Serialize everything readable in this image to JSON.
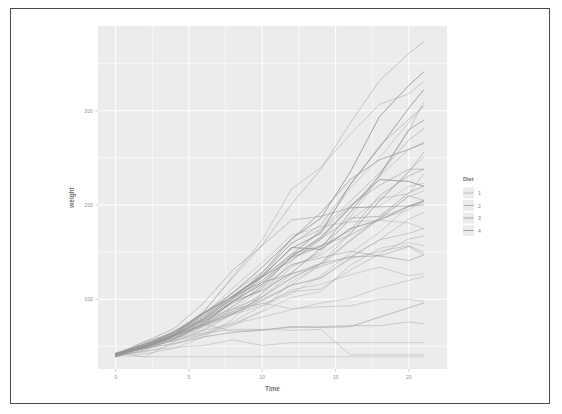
{
  "chart_data": {
    "type": "line",
    "title": "",
    "subtitle": "",
    "xlabel": "Time",
    "ylabel": "weight",
    "xlim": [
      -1.2,
      22.6
    ],
    "ylim": [
      26,
      390
    ],
    "grid": true,
    "x_ticks": [
      0,
      5,
      10,
      15,
      20
    ],
    "x_tick_labels": [
      "0",
      "5",
      "10",
      "15",
      "20"
    ],
    "y_ticks": [
      100,
      200,
      300
    ],
    "y_tick_labels": [
      "100",
      "200",
      "300"
    ],
    "x_minor_ticks": [
      2.5,
      7.5,
      12.5,
      17.5
    ],
    "y_minor_ticks": [
      50,
      150,
      250,
      350
    ],
    "legend": {
      "title": "Diet",
      "position": "right",
      "entries": [
        {
          "label": "1",
          "color": "#b3b3b3"
        },
        {
          "label": "2",
          "color": "#a8a8a8"
        },
        {
          "label": "3",
          "color": "#9d9d9d"
        },
        {
          "label": "4",
          "color": "#949494"
        }
      ]
    },
    "colors": {
      "panel_background": "#ececec",
      "gridline": "#ffffff",
      "page_background": "#ffffff",
      "frame_border": "#4a4a4a",
      "tick_text": "#9a9a9a",
      "axis_title": "#6d6d6d"
    },
    "x": [
      0,
      2,
      4,
      6,
      8,
      10,
      12,
      14,
      16,
      18,
      20,
      21
    ],
    "series": [
      {
        "name": "1",
        "diet": "1",
        "color": "#b3b3b3",
        "values": [
          42,
          51,
          59,
          64,
          76,
          93,
          106,
          125,
          149,
          171,
          199,
          205
        ]
      },
      {
        "name": "2",
        "diet": "1",
        "color": "#b3b3b3",
        "values": [
          40,
          49,
          58,
          72,
          84,
          103,
          122,
          138,
          162,
          187,
          209,
          215
        ]
      },
      {
        "name": "3",
        "diet": "1",
        "color": "#b3b3b3",
        "values": [
          43,
          39,
          55,
          67,
          84,
          99,
          115,
          138,
          163,
          187,
          198,
          202
        ]
      },
      {
        "name": "4",
        "diet": "1",
        "color": "#b3b3b3",
        "values": [
          42,
          49,
          56,
          67,
          74,
          87,
          102,
          108,
          136,
          154,
          160,
          157
        ]
      },
      {
        "name": "5",
        "diet": "1",
        "color": "#b3b3b3",
        "values": [
          41,
          42,
          48,
          60,
          79,
          106,
          141,
          164,
          197,
          199,
          220,
          223
        ]
      },
      {
        "name": "6",
        "diet": "1",
        "color": "#b3b3b3",
        "values": [
          41,
          49,
          59,
          74,
          97,
          124,
          141,
          164,
          186,
          188,
          213,
          220
        ]
      },
      {
        "name": "7",
        "diet": "1",
        "color": "#b3b3b3",
        "values": [
          41,
          49,
          57,
          71,
          89,
          112,
          146,
          174,
          218,
          250,
          288,
          305
        ]
      },
      {
        "name": "8",
        "diet": "1",
        "color": "#b3b3b3",
        "values": [
          42,
          50,
          61,
          71,
          84,
          93,
          110,
          116,
          126,
          134,
          125,
          127
        ]
      },
      {
        "name": "9",
        "diet": "1",
        "color": "#b3b3b3",
        "values": [
          42,
          51,
          59,
          68,
          85,
          96,
          90,
          92,
          93,
          100,
          100,
          98
        ]
      },
      {
        "name": "10",
        "diet": "1",
        "color": "#b3b3b3",
        "values": [
          41,
          44,
          52,
          63,
          74,
          81,
          89,
          96,
          101,
          112,
          120,
          124
        ]
      },
      {
        "name": "11",
        "diet": "1",
        "color": "#b3b3b3",
        "values": [
          43,
          51,
          63,
          84,
          112,
          139,
          168,
          177,
          182,
          184,
          181,
          175
        ]
      },
      {
        "name": "12",
        "diet": "1",
        "color": "#b3b3b3",
        "values": [
          41,
          49,
          56,
          62,
          72,
          88,
          119,
          135,
          162,
          185,
          195,
          205
        ]
      },
      {
        "name": "13",
        "diet": "1",
        "color": "#b3b3b3",
        "values": [
          41,
          48,
          53,
          60,
          65,
          67,
          71,
          70,
          71,
          81,
          91,
          96
        ]
      },
      {
        "name": "14",
        "diet": "1",
        "color": "#b3b3b3",
        "values": [
          41,
          49,
          62,
          79,
          101,
          128,
          164,
          192,
          227,
          248,
          259,
          266
        ]
      },
      {
        "name": "15",
        "diet": "1",
        "color": "#b3b3b3",
        "values": [
          41,
          49,
          56,
          64,
          68,
          68,
          67,
          68,
          41,
          41,
          41,
          41
        ]
      },
      {
        "name": "16",
        "diet": "1",
        "color": "#b3b3b3",
        "values": [
          41,
          45,
          49,
          51,
          57,
          51,
          54,
          54,
          54,
          54,
          54,
          54
        ]
      },
      {
        "name": "17",
        "diet": "1",
        "color": "#b3b3b3",
        "values": [
          41,
          49,
          59,
          74,
          97,
          124,
          141,
          164,
          186,
          188,
          213,
          220
        ]
      },
      {
        "name": "18",
        "diet": "1",
        "color": "#b3b3b3",
        "values": [
          40,
          39,
          39,
          39,
          39,
          39,
          39,
          39,
          39,
          39,
          39,
          39
        ]
      },
      {
        "name": "19",
        "diet": "1",
        "color": "#b3b3b3",
        "values": [
          41,
          49,
          61,
          74,
          98,
          109,
          128,
          154,
          192,
          232,
          280,
          290
        ]
      },
      {
        "name": "20",
        "diet": "1",
        "color": "#b3b3b3",
        "values": [
          41,
          48,
          53,
          60,
          65,
          67,
          71,
          70,
          71,
          81,
          91,
          96
        ]
      },
      {
        "name": "21",
        "diet": "2",
        "color": "#a8a8a8",
        "values": [
          40,
          50,
          62,
          86,
          125,
          163,
          217,
          240,
          275,
          307,
          318,
          331
        ]
      },
      {
        "name": "22",
        "diet": "2",
        "color": "#a8a8a8",
        "values": [
          41,
          55,
          64,
          77,
          90,
          95,
          108,
          111,
          131,
          148,
          164,
          167
        ]
      },
      {
        "name": "23",
        "diet": "2",
        "color": "#a8a8a8",
        "values": [
          43,
          52,
          61,
          73,
          90,
          103,
          127,
          135,
          145,
          163,
          170,
          175
        ]
      },
      {
        "name": "24",
        "diet": "2",
        "color": "#a8a8a8",
        "values": [
          42,
          52,
          58,
          74,
          66,
          68,
          70,
          71,
          72,
          72,
          76,
          74
        ]
      },
      {
        "name": "25",
        "diet": "2",
        "color": "#a8a8a8",
        "values": [
          40,
          49,
          62,
          78,
          102,
          124,
          146,
          164,
          197,
          231,
          259,
          265
        ]
      },
      {
        "name": "26",
        "diet": "2",
        "color": "#a8a8a8",
        "values": [
          42,
          48,
          57,
          74,
          93,
          114,
          136,
          147,
          169,
          205,
          236,
          251
        ]
      },
      {
        "name": "27",
        "diet": "2",
        "color": "#a8a8a8",
        "values": [
          39,
          46,
          58,
          73,
          87,
          100,
          115,
          123,
          144,
          163,
          185,
          192
        ]
      },
      {
        "name": "28",
        "diet": "2",
        "color": "#a8a8a8",
        "values": [
          39,
          46,
          58,
          73,
          92,
          114,
          145,
          156,
          184,
          207,
          212,
          233
        ]
      },
      {
        "name": "29",
        "diet": "2",
        "color": "#a8a8a8",
        "values": [
          39,
          48,
          59,
          74,
          87,
          106,
          134,
          150,
          187,
          230,
          279,
          309
        ]
      },
      {
        "name": "30",
        "diet": "2",
        "color": "#a8a8a8",
        "values": [
          42,
          48,
          59,
          72,
          85,
          98,
          115,
          122,
          143,
          151,
          157,
          150
        ]
      },
      {
        "name": "31",
        "diet": "3",
        "color": "#9d9d9d",
        "values": [
          42,
          53,
          62,
          73,
          85,
          102,
          123,
          138,
          170,
          204,
          235,
          256
        ]
      },
      {
        "name": "32",
        "diet": "3",
        "color": "#9d9d9d",
        "values": [
          41,
          49,
          65,
          82,
          107,
          129,
          159,
          179,
          221,
          263,
          291,
          305
        ]
      },
      {
        "name": "33",
        "diet": "3",
        "color": "#9d9d9d",
        "values": [
          39,
          50,
          63,
          77,
          96,
          111,
          137,
          144,
          151,
          146,
          156,
          147
        ]
      },
      {
        "name": "34",
        "diet": "3",
        "color": "#9d9d9d",
        "values": [
          41,
          49,
          63,
          85,
          107,
          134,
          164,
          186,
          235,
          294,
          327,
          341
        ]
      },
      {
        "name": "35",
        "diet": "3",
        "color": "#9d9d9d",
        "values": [
          41,
          53,
          64,
          87,
          123,
          158,
          201,
          238,
          287,
          332,
          361,
          373
        ]
      },
      {
        "name": "36",
        "diet": "3",
        "color": "#9d9d9d",
        "values": [
          39,
          50,
          62,
          80,
          104,
          125,
          154,
          170,
          222,
          261,
          303,
          322
        ]
      },
      {
        "name": "37",
        "diet": "3",
        "color": "#9d9d9d",
        "values": [
          41,
          48,
          61,
          76,
          98,
          116,
          145,
          166,
          198,
          227,
          225,
          220
        ]
      },
      {
        "name": "38",
        "diet": "3",
        "color": "#9d9d9d",
        "values": [
          41,
          49,
          62,
          79,
          101,
          128,
          164,
          192,
          227,
          248,
          259,
          266
        ]
      },
      {
        "name": "39",
        "diet": "3",
        "color": "#9d9d9d",
        "values": [
          42,
          51,
          66,
          85,
          103,
          124,
          155,
          153,
          175,
          184,
          199,
          204
        ]
      },
      {
        "name": "40",
        "diet": "3",
        "color": "#9d9d9d",
        "values": [
          42,
          49,
          63,
          84,
          103,
          126,
          160,
          174,
          204,
          234,
          269,
          281
        ]
      },
      {
        "name": "41",
        "diet": "4",
        "color": "#949494",
        "values": [
          42,
          51,
          66,
          85,
          103,
          124,
          155,
          153,
          175,
          184,
          199,
          204
        ]
      },
      {
        "name": "42",
        "diet": "4",
        "color": "#949494",
        "values": [
          41,
          49,
          63,
          85,
          107,
          134,
          164,
          186,
          235,
          294,
          327,
          341
        ]
      },
      {
        "name": "43",
        "diet": "4",
        "color": "#949494",
        "values": [
          42,
          55,
          69,
          96,
          131,
          157,
          184,
          188,
          197,
          198,
          199,
          200
        ]
      },
      {
        "name": "44",
        "diet": "4",
        "color": "#949494",
        "values": [
          42,
          51,
          65,
          86,
          103,
          118,
          127,
          138,
          145,
          146,
          141,
          147
        ]
      },
      {
        "name": "45",
        "diet": "4",
        "color": "#949494",
        "values": [
          41,
          50,
          61,
          78,
          98,
          118,
          148,
          172,
          200,
          221,
          238,
          238
        ]
      },
      {
        "name": "46",
        "diet": "4",
        "color": "#949494",
        "values": [
          40,
          52,
          62,
          82,
          101,
          120,
          144,
          156,
          173,
          210,
          231,
          238
        ]
      },
      {
        "name": "47",
        "diet": "4",
        "color": "#949494",
        "values": [
          41,
          53,
          66,
          79,
          100,
          123,
          148,
          157,
          168,
          185,
          210,
          205
        ]
      },
      {
        "name": "48",
        "diet": "4",
        "color": "#949494",
        "values": [
          39,
          50,
          62,
          80,
          104,
          125,
          154,
          170,
          222,
          261,
          303,
          322
        ]
      },
      {
        "name": "49",
        "diet": "4",
        "color": "#949494",
        "values": [
          41,
          48,
          61,
          76,
          98,
          116,
          145,
          166,
          198,
          227,
          225,
          220
        ]
      },
      {
        "name": "50",
        "diet": "4",
        "color": "#949494",
        "values": [
          41,
          49,
          61,
          74,
          98,
          109,
          128,
          154,
          192,
          232,
          280,
          290
        ]
      }
    ]
  }
}
